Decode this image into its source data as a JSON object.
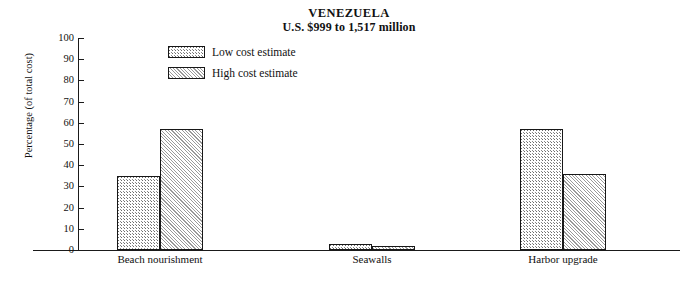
{
  "chart_data": {
    "type": "bar",
    "title": "VENEZUELA",
    "subtitle": "U.S. $999 to 1,517 million",
    "xlabel": "",
    "ylabel": "Percentage (of total cost)",
    "ylim": [
      0,
      100
    ],
    "yticks": [
      0,
      10,
      20,
      30,
      40,
      50,
      60,
      70,
      80,
      90,
      100
    ],
    "grid": false,
    "legend_position": "upper-left-inside",
    "categories": [
      "Beach nourishment",
      "Seawalls",
      "Harbor upgrade"
    ],
    "series": [
      {
        "name": "Low cost estimate",
        "fill": "stipple",
        "values": [
          35,
          3,
          57
        ]
      },
      {
        "name": "High cost estimate",
        "fill": "diagonal-hatch",
        "values": [
          57,
          2,
          36
        ]
      }
    ]
  },
  "legend": {
    "items": [
      {
        "label": "Low cost estimate"
      },
      {
        "label": "High cost estimate"
      }
    ]
  },
  "colors": {
    "axis": "#1a1a1a",
    "bar_border": "#171717",
    "stipple": "#6b6b6b",
    "hatch": "#9a9a9a",
    "background": "#ffffff"
  }
}
